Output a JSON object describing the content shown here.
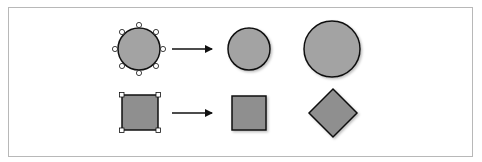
{
  "diagram": {
    "colors": {
      "fill": "#a3a3a3",
      "fill_square": "#8f8f8f",
      "stroke": "#111111",
      "handle_fill": "#ffffff",
      "frame_border": "#b8b8b8",
      "shadow": "#d0d0d0"
    },
    "rows": [
      {
        "name": "circle-row",
        "shapes": [
          {
            "type": "circle",
            "state": "selected-with-8-handles"
          },
          {
            "type": "arrow"
          },
          {
            "type": "circle",
            "state": "normal"
          },
          {
            "type": "circle",
            "state": "enlarged"
          }
        ]
      },
      {
        "name": "square-row",
        "shapes": [
          {
            "type": "square",
            "state": "selected-with-4-corner-handles"
          },
          {
            "type": "arrow"
          },
          {
            "type": "square",
            "state": "normal"
          },
          {
            "type": "diamond",
            "state": "rotated-45"
          }
        ]
      }
    ]
  }
}
